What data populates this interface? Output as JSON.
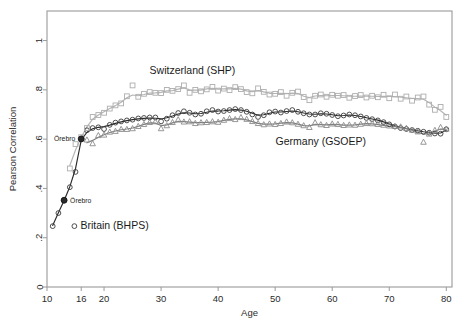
{
  "figure": {
    "background_color": "#ffffff",
    "frame_color": "#9a9a9a",
    "plot_area": {
      "left": 47,
      "top": 11,
      "right": 452,
      "bottom": 287
    }
  },
  "chart_data": {
    "type": "scatter",
    "title": "",
    "xlabel": "Age",
    "ylabel": "Pearson Correlation",
    "xlim": [
      10,
      81
    ],
    "ylim": [
      0,
      1.12
    ],
    "xticks": [
      10,
      16,
      20,
      30,
      40,
      50,
      60,
      70,
      80
    ],
    "xticklabels": [
      "10",
      "16",
      "20",
      "30",
      "40",
      "50",
      "60",
      "70",
      "80"
    ],
    "yticks": [
      0,
      0.2,
      0.4,
      0.6,
      0.8,
      1
    ],
    "yticklabels": [
      "0",
      ".2",
      ".4",
      ".6",
      ".8",
      "1"
    ],
    "grid": false,
    "legend_position": "inline-annotations",
    "series": [
      {
        "name": "Britain (BHPS)",
        "marker": "circle",
        "color": "#3a3a3a",
        "line_color": "#2a2a2a",
        "x": [
          11,
          12,
          13,
          14,
          15,
          16,
          17,
          18,
          19,
          20,
          21,
          22,
          23,
          24,
          25,
          26,
          27,
          28,
          29,
          30,
          31,
          32,
          33,
          34,
          35,
          36,
          37,
          38,
          39,
          40,
          41,
          42,
          43,
          44,
          45,
          46,
          47,
          48,
          49,
          50,
          51,
          52,
          53,
          54,
          55,
          56,
          57,
          58,
          59,
          60,
          61,
          62,
          63,
          64,
          65,
          66,
          67,
          68,
          69,
          70,
          71,
          72,
          73,
          74,
          75,
          76,
          77,
          78,
          79,
          80
        ],
        "y": [
          0.247,
          0.3,
          0.352,
          0.405,
          0.467,
          0.601,
          0.636,
          0.645,
          0.648,
          0.641,
          0.658,
          0.667,
          0.672,
          0.676,
          0.679,
          0.684,
          0.686,
          0.688,
          0.688,
          0.672,
          0.683,
          0.697,
          0.706,
          0.713,
          0.707,
          0.7,
          0.703,
          0.713,
          0.718,
          0.712,
          0.714,
          0.718,
          0.722,
          0.718,
          0.711,
          0.7,
          0.69,
          0.697,
          0.709,
          0.712,
          0.708,
          0.714,
          0.718,
          0.711,
          0.705,
          0.7,
          0.7,
          0.705,
          0.703,
          0.698,
          0.693,
          0.696,
          0.7,
          0.697,
          0.692,
          0.686,
          0.681,
          0.676,
          0.669,
          0.66,
          0.651,
          0.645,
          0.641,
          0.637,
          0.634,
          0.63,
          0.626,
          0.623,
          0.622,
          0.64
        ],
        "smooth_y": [
          0.25,
          0.301,
          0.351,
          0.407,
          0.48,
          0.596,
          0.628,
          0.642,
          0.648,
          0.651,
          0.657,
          0.664,
          0.67,
          0.675,
          0.679,
          0.682,
          0.684,
          0.686,
          0.685,
          0.682,
          0.687,
          0.694,
          0.702,
          0.707,
          0.706,
          0.703,
          0.704,
          0.709,
          0.714,
          0.714,
          0.715,
          0.718,
          0.72,
          0.718,
          0.713,
          0.705,
          0.697,
          0.699,
          0.705,
          0.71,
          0.71,
          0.712,
          0.714,
          0.711,
          0.706,
          0.702,
          0.701,
          0.703,
          0.702,
          0.699,
          0.695,
          0.696,
          0.698,
          0.696,
          0.692,
          0.687,
          0.682,
          0.677,
          0.67,
          0.662,
          0.654,
          0.647,
          0.642,
          0.638,
          0.634,
          0.63,
          0.627,
          0.624,
          0.625,
          0.636
        ]
      },
      {
        "name": "Switzerland (SHP)",
        "marker": "square",
        "color": "#adadad",
        "line_color": "#b4b4b4",
        "x": [
          14,
          15,
          16,
          17,
          18,
          19,
          20,
          21,
          22,
          23,
          24,
          25,
          26,
          27,
          28,
          29,
          30,
          31,
          32,
          33,
          34,
          35,
          36,
          37,
          38,
          39,
          40,
          41,
          42,
          43,
          44,
          45,
          46,
          47,
          48,
          49,
          50,
          51,
          52,
          53,
          54,
          55,
          56,
          57,
          58,
          59,
          60,
          61,
          62,
          63,
          64,
          65,
          66,
          67,
          68,
          69,
          70,
          71,
          72,
          73,
          74,
          75,
          76,
          77,
          78,
          79,
          80
        ],
        "y": [
          0.481,
          0.58,
          0.608,
          0.645,
          0.69,
          0.698,
          0.707,
          0.724,
          0.737,
          0.745,
          0.774,
          0.818,
          0.772,
          0.784,
          0.791,
          0.788,
          0.787,
          0.8,
          0.796,
          0.803,
          0.818,
          0.788,
          0.8,
          0.794,
          0.802,
          0.812,
          0.797,
          0.805,
          0.799,
          0.811,
          0.803,
          0.791,
          0.786,
          0.806,
          0.792,
          0.781,
          0.784,
          0.791,
          0.776,
          0.788,
          0.793,
          0.771,
          0.758,
          0.776,
          0.781,
          0.772,
          0.78,
          0.776,
          0.779,
          0.768,
          0.775,
          0.779,
          0.769,
          0.776,
          0.77,
          0.78,
          0.766,
          0.781,
          0.764,
          0.773,
          0.756,
          0.769,
          0.773,
          0.74,
          0.719,
          0.731,
          0.69
        ],
        "smooth_y": [
          0.493,
          0.556,
          0.607,
          0.65,
          0.681,
          0.698,
          0.711,
          0.724,
          0.736,
          0.75,
          0.768,
          0.779,
          0.776,
          0.781,
          0.787,
          0.788,
          0.79,
          0.796,
          0.797,
          0.803,
          0.808,
          0.8,
          0.799,
          0.799,
          0.804,
          0.806,
          0.803,
          0.804,
          0.804,
          0.806,
          0.803,
          0.796,
          0.793,
          0.797,
          0.792,
          0.786,
          0.785,
          0.786,
          0.784,
          0.787,
          0.785,
          0.774,
          0.769,
          0.775,
          0.777,
          0.776,
          0.777,
          0.777,
          0.776,
          0.774,
          0.774,
          0.775,
          0.774,
          0.774,
          0.773,
          0.774,
          0.773,
          0.773,
          0.77,
          0.768,
          0.765,
          0.765,
          0.762,
          0.748,
          0.73,
          0.715,
          0.697
        ]
      },
      {
        "name": "Germany (GSOEP)",
        "marker": "triangle",
        "color": "#8c8c8c",
        "line_color": "#7e7e7e",
        "x": [
          17,
          18,
          19,
          20,
          21,
          22,
          23,
          24,
          25,
          26,
          27,
          28,
          29,
          30,
          31,
          32,
          33,
          34,
          35,
          36,
          37,
          38,
          39,
          40,
          41,
          42,
          43,
          44,
          45,
          46,
          47,
          48,
          49,
          50,
          51,
          52,
          53,
          54,
          55,
          56,
          57,
          58,
          59,
          60,
          61,
          62,
          63,
          64,
          65,
          66,
          67,
          68,
          69,
          70,
          71,
          72,
          73,
          74,
          75,
          76,
          77,
          78,
          79,
          80
        ],
        "y": [
          0.597,
          0.582,
          0.615,
          0.617,
          0.629,
          0.632,
          0.64,
          0.64,
          0.643,
          0.652,
          0.66,
          0.668,
          0.671,
          0.643,
          0.655,
          0.668,
          0.679,
          0.67,
          0.671,
          0.664,
          0.667,
          0.668,
          0.671,
          0.669,
          0.677,
          0.684,
          0.68,
          0.688,
          0.681,
          0.672,
          0.664,
          0.659,
          0.662,
          0.66,
          0.664,
          0.67,
          0.667,
          0.661,
          0.655,
          0.648,
          0.667,
          0.659,
          0.656,
          0.662,
          0.66,
          0.656,
          0.658,
          0.657,
          0.661,
          0.664,
          0.663,
          0.66,
          0.657,
          0.654,
          0.652,
          0.65,
          0.644,
          0.637,
          0.63,
          0.588,
          0.621,
          0.636,
          0.648,
          0.641
        ],
        "smooth_y": [
          0.585,
          0.595,
          0.608,
          0.618,
          0.627,
          0.633,
          0.638,
          0.641,
          0.645,
          0.652,
          0.66,
          0.666,
          0.665,
          0.655,
          0.658,
          0.666,
          0.672,
          0.671,
          0.669,
          0.667,
          0.667,
          0.668,
          0.669,
          0.671,
          0.676,
          0.68,
          0.682,
          0.682,
          0.678,
          0.671,
          0.664,
          0.661,
          0.661,
          0.662,
          0.665,
          0.667,
          0.666,
          0.661,
          0.655,
          0.654,
          0.66,
          0.659,
          0.658,
          0.66,
          0.659,
          0.657,
          0.657,
          0.658,
          0.661,
          0.663,
          0.662,
          0.659,
          0.656,
          0.653,
          0.651,
          0.648,
          0.643,
          0.636,
          0.628,
          0.62,
          0.622,
          0.632,
          0.641,
          0.64
        ]
      }
    ],
    "annotations": [
      {
        "id": "orebro-upper",
        "text": "Örebro",
        "x": 16,
        "y": 0.601,
        "marker": "filled-circle",
        "label_side": "left"
      },
      {
        "id": "orebro-lower",
        "text": "Örebro",
        "x": 13,
        "y": 0.352,
        "marker": "filled-circle",
        "label_side": "right"
      },
      {
        "id": "label-switzerland",
        "text": "Switzerland (SHP)",
        "x": 35.5,
        "y": 0.875,
        "marker": "none",
        "label_side": "center"
      },
      {
        "id": "label-germany",
        "text": "Germany (GSOEP)",
        "x": 58.0,
        "y": 0.585,
        "marker": "none",
        "label_side": "center"
      },
      {
        "id": "label-britain",
        "text": "Britain (BHPS)",
        "x": 14.8,
        "y": 0.247,
        "marker": "open-circle",
        "label_side": "right"
      }
    ]
  }
}
